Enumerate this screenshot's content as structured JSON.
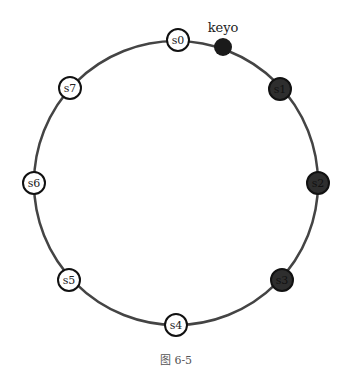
{
  "diagram": {
    "type": "consistent-hashing-ring",
    "ring": {
      "cx": 176,
      "cy": 183,
      "r": 142,
      "stroke": "#444444"
    },
    "servers": [
      {
        "id": "s0",
        "label": "s0",
        "x": 178,
        "y": 40,
        "filled": false
      },
      {
        "id": "s1",
        "label": "s1",
        "x": 280,
        "y": 89,
        "filled": true
      },
      {
        "id": "s2",
        "label": "s2",
        "x": 318,
        "y": 183,
        "filled": true
      },
      {
        "id": "s3",
        "label": "s3",
        "x": 282,
        "y": 280,
        "filled": true
      },
      {
        "id": "s4",
        "label": "s4",
        "x": 176,
        "y": 325,
        "filled": false
      },
      {
        "id": "s5",
        "label": "s5",
        "x": 69,
        "y": 280,
        "filled": false
      },
      {
        "id": "s6",
        "label": "s6",
        "x": 34,
        "y": 183,
        "filled": false
      },
      {
        "id": "s7",
        "label": "s7",
        "x": 70,
        "y": 88,
        "filled": false
      }
    ],
    "key": {
      "label": "keyo",
      "x": 223,
      "y": 47,
      "color": "#1a1a1a"
    },
    "colors": {
      "filled_node": "#2e2e2e",
      "empty_node": "#ffffff",
      "node_stroke": "#111111"
    }
  },
  "caption": "图 6-5"
}
